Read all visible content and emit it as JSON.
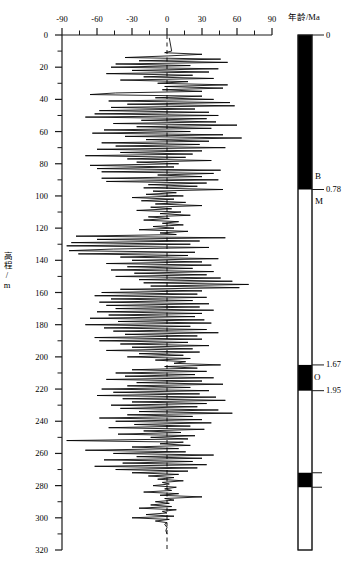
{
  "figure": {
    "type": "paleomagnetic-stratigraphy",
    "caption": ""
  },
  "xaxis": {
    "title": "",
    "ticks": [
      "-90",
      "-60",
      "-30",
      "0",
      "30",
      "60",
      "90"
    ],
    "min": -90,
    "max": 90,
    "minor_step": 15
  },
  "yaxis": {
    "title": "高程/m",
    "ticks": [
      "0",
      "20",
      "40",
      "60",
      "80",
      "100",
      "120",
      "140",
      "160",
      "180",
      "200",
      "220",
      "240",
      "260",
      "280",
      "300",
      "320"
    ],
    "min": 0,
    "max": 320,
    "minor_step": 10
  },
  "age_column": {
    "title": "年龄/Ma",
    "tick_labels": [
      "0",
      "0.78",
      "1.67",
      "1.95"
    ],
    "chron_labels": [
      "B",
      "M",
      "O"
    ]
  },
  "chart_data": {
    "type": "line",
    "title": "",
    "xlabel": "",
    "ylabel": "高程/m",
    "xlim": [
      -90,
      90
    ],
    "ylim": [
      320,
      0
    ],
    "grid": false,
    "legend": null,
    "reference_line": {
      "x": 0,
      "style": "dashed"
    },
    "series": [
      {
        "name": "磁倾角",
        "xlabel_units": "degrees",
        "points": [
          [
            2,
            2
          ],
          [
            4,
            10
          ],
          [
            -2,
            11
          ],
          [
            30,
            12
          ],
          [
            1,
            13
          ],
          [
            -36,
            14
          ],
          [
            46,
            15
          ],
          [
            -24,
            16
          ],
          [
            52,
            17
          ],
          [
            -44,
            18
          ],
          [
            20,
            19
          ],
          [
            -48,
            20
          ],
          [
            44,
            21
          ],
          [
            -30,
            22
          ],
          [
            36,
            23
          ],
          [
            -52,
            24
          ],
          [
            22,
            25
          ],
          [
            -20,
            26
          ],
          [
            40,
            27
          ],
          [
            -40,
            28
          ],
          [
            18,
            29
          ],
          [
            -8,
            30
          ],
          [
            52,
            31
          ],
          [
            -2,
            32
          ],
          [
            48,
            33
          ],
          [
            -4,
            34
          ],
          [
            30,
            35
          ],
          [
            -44,
            36
          ],
          [
            -66,
            37
          ],
          [
            30,
            38
          ],
          [
            -10,
            39
          ],
          [
            40,
            40
          ],
          [
            -50,
            41
          ],
          [
            54,
            42
          ],
          [
            -34,
            43
          ],
          [
            58,
            44
          ],
          [
            -48,
            45
          ],
          [
            24,
            46
          ],
          [
            -58,
            47
          ],
          [
            36,
            48
          ],
          [
            -62,
            49
          ],
          [
            44,
            50
          ],
          [
            -70,
            51
          ],
          [
            34,
            52
          ],
          [
            -22,
            53
          ],
          [
            42,
            54
          ],
          [
            -46,
            55
          ],
          [
            60,
            56
          ],
          [
            -26,
            57
          ],
          [
            38,
            58
          ],
          [
            -54,
            59
          ],
          [
            20,
            60
          ],
          [
            -64,
            61
          ],
          [
            48,
            62
          ],
          [
            -36,
            63
          ],
          [
            64,
            64
          ],
          [
            -18,
            65
          ],
          [
            36,
            66
          ],
          [
            -56,
            67
          ],
          [
            28,
            68
          ],
          [
            -44,
            69
          ],
          [
            50,
            70
          ],
          [
            -60,
            71
          ],
          [
            30,
            72
          ],
          [
            -40,
            73
          ],
          [
            22,
            74
          ],
          [
            -70,
            75
          ],
          [
            16,
            76
          ],
          [
            -34,
            77
          ],
          [
            38,
            78
          ],
          [
            -26,
            79
          ],
          [
            10,
            80
          ],
          [
            -66,
            81
          ],
          [
            6,
            82
          ],
          [
            -60,
            83
          ],
          [
            46,
            84
          ],
          [
            -56,
            85
          ],
          [
            40,
            86
          ],
          [
            -8,
            87
          ],
          [
            30,
            88
          ],
          [
            -56,
            89
          ],
          [
            44,
            90
          ],
          [
            -52,
            91
          ],
          [
            34,
            92
          ],
          [
            -16,
            93
          ],
          [
            26,
            94
          ],
          [
            -20,
            95
          ],
          [
            48,
            96
          ],
          [
            -12,
            97
          ],
          [
            8,
            98
          ],
          [
            -18,
            99
          ],
          [
            14,
            100
          ],
          [
            -30,
            101
          ],
          [
            6,
            102
          ],
          [
            -22,
            103
          ],
          [
            16,
            104
          ],
          [
            -10,
            105
          ],
          [
            30,
            106
          ],
          [
            -14,
            107
          ],
          [
            4,
            108
          ],
          [
            -26,
            109
          ],
          [
            12,
            110
          ],
          [
            -6,
            111
          ],
          [
            20,
            112
          ],
          [
            -16,
            113
          ],
          [
            2,
            114
          ],
          [
            -20,
            115
          ],
          [
            10,
            116
          ],
          [
            -4,
            117
          ],
          [
            14,
            118
          ],
          [
            -12,
            119
          ],
          [
            6,
            120
          ],
          [
            -24,
            121
          ],
          [
            18,
            122
          ],
          [
            -6,
            123
          ],
          [
            8,
            124
          ],
          [
            -78,
            125
          ],
          [
            50,
            126
          ],
          [
            -60,
            127
          ],
          [
            28,
            128
          ],
          [
            -82,
            129
          ],
          [
            20,
            130
          ],
          [
            -86,
            131
          ],
          [
            36,
            132
          ],
          [
            -46,
            133
          ],
          [
            -84,
            134
          ],
          [
            24,
            135
          ],
          [
            -76,
            136
          ],
          [
            18,
            137
          ],
          [
            -40,
            138
          ],
          [
            44,
            139
          ],
          [
            -30,
            140
          ],
          [
            30,
            141
          ],
          [
            -52,
            142
          ],
          [
            38,
            143
          ],
          [
            -34,
            144
          ],
          [
            22,
            145
          ],
          [
            -48,
            146
          ],
          [
            40,
            147
          ],
          [
            -28,
            148
          ],
          [
            34,
            149
          ],
          [
            -44,
            150
          ],
          [
            46,
            151
          ],
          [
            -24,
            152
          ],
          [
            56,
            153
          ],
          [
            -20,
            154
          ],
          [
            70,
            155
          ],
          [
            -14,
            156
          ],
          [
            62,
            157
          ],
          [
            -40,
            158
          ],
          [
            30,
            159
          ],
          [
            -56,
            160
          ],
          [
            26,
            161
          ],
          [
            -62,
            162
          ],
          [
            34,
            163
          ],
          [
            -48,
            164
          ],
          [
            22,
            165
          ],
          [
            -58,
            166
          ],
          [
            36,
            167
          ],
          [
            -52,
            168
          ],
          [
            28,
            169
          ],
          [
            -44,
            170
          ],
          [
            40,
            171
          ],
          [
            -60,
            172
          ],
          [
            30,
            173
          ],
          [
            -50,
            174
          ],
          [
            24,
            175
          ],
          [
            -66,
            176
          ],
          [
            32,
            177
          ],
          [
            -42,
            178
          ],
          [
            38,
            179
          ],
          [
            -70,
            180
          ],
          [
            20,
            181
          ],
          [
            -54,
            182
          ],
          [
            34,
            183
          ],
          [
            -46,
            184
          ],
          [
            44,
            185
          ],
          [
            -36,
            186
          ],
          [
            26,
            187
          ],
          [
            -62,
            188
          ],
          [
            30,
            189
          ],
          [
            -58,
            190
          ],
          [
            18,
            191
          ],
          [
            -40,
            192
          ],
          [
            36,
            193
          ],
          [
            -30,
            194
          ],
          [
            22,
            195
          ],
          [
            -52,
            196
          ],
          [
            28,
            197
          ],
          [
            -24,
            198
          ],
          [
            14,
            199
          ],
          [
            -34,
            200
          ],
          [
            20,
            201
          ],
          [
            -10,
            202
          ],
          [
            16,
            203
          ],
          [
            6,
            204
          ],
          [
            46,
            205
          ],
          [
            -2,
            206
          ],
          [
            26,
            207
          ],
          [
            -30,
            208
          ],
          [
            34,
            209
          ],
          [
            -44,
            210
          ],
          [
            24,
            211
          ],
          [
            -36,
            212
          ],
          [
            40,
            213
          ],
          [
            -52,
            214
          ],
          [
            30,
            215
          ],
          [
            -26,
            216
          ],
          [
            48,
            217
          ],
          [
            -34,
            218
          ],
          [
            20,
            219
          ],
          [
            -56,
            220
          ],
          [
            36,
            221
          ],
          [
            -46,
            222
          ],
          [
            28,
            223
          ],
          [
            -60,
            224
          ],
          [
            42,
            225
          ],
          [
            -38,
            226
          ],
          [
            50,
            227
          ],
          [
            -30,
            228
          ],
          [
            34,
            229
          ],
          [
            -48,
            230
          ],
          [
            26,
            231
          ],
          [
            -40,
            232
          ],
          [
            44,
            233
          ],
          [
            -24,
            234
          ],
          [
            56,
            235
          ],
          [
            -34,
            236
          ],
          [
            22,
            237
          ],
          [
            -58,
            238
          ],
          [
            30,
            239
          ],
          [
            -44,
            240
          ],
          [
            38,
            241
          ],
          [
            -28,
            242
          ],
          [
            20,
            243
          ],
          [
            -50,
            244
          ],
          [
            32,
            245
          ],
          [
            -20,
            246
          ],
          [
            12,
            247
          ],
          [
            -42,
            248
          ],
          [
            24,
            249
          ],
          [
            -14,
            250
          ],
          [
            18,
            251
          ],
          [
            -86,
            252
          ],
          [
            14,
            253
          ],
          [
            -6,
            254
          ],
          [
            20,
            255
          ],
          [
            -30,
            256
          ],
          [
            10,
            257
          ],
          [
            -70,
            258
          ],
          [
            16,
            259
          ],
          [
            -46,
            260
          ],
          [
            40,
            261
          ],
          [
            -26,
            262
          ],
          [
            30,
            263
          ],
          [
            -54,
            264
          ],
          [
            22,
            265
          ],
          [
            -38,
            266
          ],
          [
            34,
            267
          ],
          [
            -62,
            268
          ],
          [
            26,
            269
          ],
          [
            -44,
            270
          ],
          [
            18,
            271
          ],
          [
            -30,
            272
          ],
          [
            10,
            273
          ],
          [
            -16,
            274
          ],
          [
            6,
            275
          ],
          [
            -8,
            276
          ],
          [
            14,
            277
          ],
          [
            -4,
            278
          ],
          [
            2,
            279
          ],
          [
            -12,
            280
          ],
          [
            8,
            281
          ],
          [
            -2,
            282
          ],
          [
            4,
            283
          ],
          [
            -20,
            284
          ],
          [
            10,
            285
          ],
          [
            -6,
            286
          ],
          [
            30,
            287
          ],
          [
            -2,
            288
          ],
          [
            6,
            289
          ],
          [
            -10,
            290
          ],
          [
            2,
            291
          ],
          [
            -14,
            292
          ],
          [
            4,
            293
          ],
          [
            -24,
            294
          ],
          [
            8,
            295
          ],
          [
            -4,
            296
          ],
          [
            0,
            297
          ],
          [
            -18,
            298
          ],
          [
            6,
            299
          ],
          [
            -30,
            300
          ],
          [
            2,
            301
          ],
          [
            -10,
            302
          ],
          [
            0,
            303
          ],
          [
            -2,
            304
          ],
          [
            0,
            306
          ],
          [
            -1,
            308
          ],
          [
            0,
            310
          ]
        ]
      }
    ],
    "polarity_log": {
      "axis": "age",
      "unit": "Ma",
      "bands": [
        {
          "label": "B",
          "polarity": "normal",
          "top_m": 0,
          "bottom_m": 96,
          "age_top": "0",
          "age_bottom": "0.78"
        },
        {
          "label": "M",
          "polarity": "reversed",
          "top_m": 96,
          "bottom_m": 205,
          "age_top": "0.78",
          "age_bottom": "1.67"
        },
        {
          "label": "O",
          "polarity": "normal",
          "top_m": 205,
          "bottom_m": 221,
          "age_top": "1.67",
          "age_bottom": "1.95"
        },
        {
          "label": "",
          "polarity": "reversed",
          "top_m": 221,
          "bottom_m": 272,
          "age_top": "1.95",
          "age_bottom": ""
        },
        {
          "label": "",
          "polarity": "normal",
          "top_m": 272,
          "bottom_m": 281,
          "age_top": "",
          "age_bottom": ""
        },
        {
          "label": "",
          "polarity": "reversed",
          "top_m": 281,
          "bottom_m": 320,
          "age_top": "",
          "age_bottom": ""
        }
      ]
    }
  },
  "colors": {
    "normal_polarity": "#000000",
    "reversed_polarity": "#ffffff",
    "axis": "#1a1a1a",
    "trace": "#000000"
  }
}
